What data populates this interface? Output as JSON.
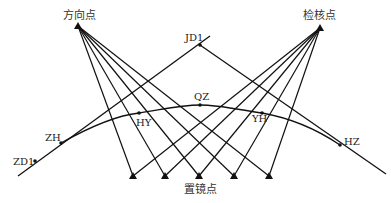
{
  "diagram": {
    "type": "surveying-curve-setout",
    "labels": {
      "direction_point": "方向点",
      "check_point": "检核点",
      "station_point": "置镜点",
      "jd1": "JD1",
      "qz": "QZ",
      "hy": "HY",
      "yh": "YH",
      "zh": "ZH",
      "hz": "HZ",
      "zd1": "ZD1"
    },
    "points": {
      "direction_point": [
        78,
        26
      ],
      "check_point": [
        320,
        28
      ],
      "jd1": [
        200,
        45
      ],
      "qz": [
        200,
        105
      ],
      "hy": [
        139,
        113
      ],
      "yh": [
        262,
        113
      ],
      "zh": [
        61,
        143
      ],
      "hz": [
        340,
        145
      ],
      "zd1": [
        35,
        161
      ]
    },
    "station_points": [
      [
        133,
        176
      ],
      [
        165,
        176
      ],
      [
        199,
        176
      ],
      [
        234,
        176
      ],
      [
        269,
        176
      ]
    ],
    "colors": {
      "line": "#111111",
      "text": "#222222",
      "background": "#ffffff"
    }
  }
}
